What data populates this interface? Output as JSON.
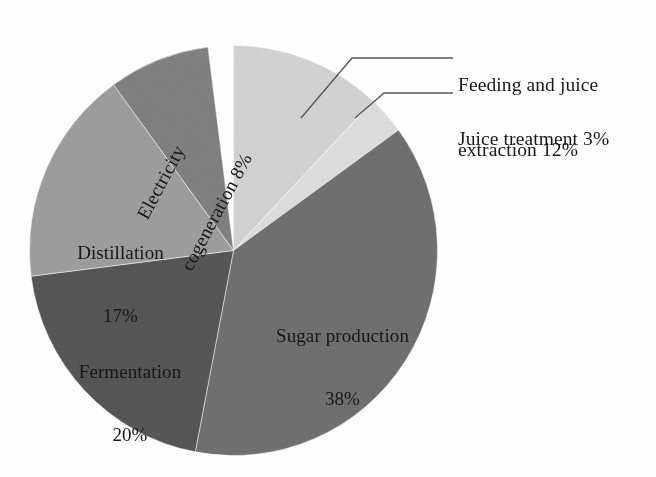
{
  "figure": {
    "type": "pie-chart-figure",
    "background": "#ffffff"
  },
  "chart_data": {
    "type": "pie",
    "title": "",
    "subtitle": "",
    "xlabel": "",
    "ylabel": "",
    "legend_position": "none",
    "grid": false,
    "units": "percent",
    "total": 98,
    "start_angle_deg": 0,
    "direction": "clockwise",
    "labels_show_percent": true,
    "categories": [
      "Feeding and juice extraction",
      "Juice treatment",
      "Sugar production",
      "Fermentation",
      "Distillation",
      "Electricity cogeneration"
    ],
    "values": [
      12,
      3,
      38,
      20,
      17,
      8
    ],
    "slices": [
      {
        "name": "Feeding and juice extraction",
        "value": 12,
        "percent_text": "12%",
        "label_text": "Feeding and juice\nextraction 12%",
        "label_line1": "Feeding and juice",
        "label_line2": "extraction 12%",
        "label_placement": "outside",
        "color": "#e9e9e9",
        "start_deg": 0,
        "end_deg": 43.2
      },
      {
        "name": "Juice treatment",
        "value": 3,
        "percent_text": "3%",
        "label_text": "Juice treatment 3%",
        "label_line1": "Juice treatment 3%",
        "label_line2": "",
        "label_placement": "outside",
        "color": "#efefef",
        "start_deg": 43.2,
        "end_deg": 54.0
      },
      {
        "name": "Sugar production",
        "value": 38,
        "percent_text": "38%",
        "label_text": "Sugar production\n38%",
        "label_line1": "Sugar production",
        "label_line2": "38%",
        "label_placement": "inside",
        "color": "#a9a9a9",
        "start_deg": 54.0,
        "end_deg": 190.8
      },
      {
        "name": "Fermentation",
        "value": 20,
        "percent_text": "20%",
        "label_text": "Fermentation\n20%",
        "label_line1": "Fermentation",
        "label_line2": "20%",
        "label_placement": "inside",
        "color": "#949494",
        "start_deg": 190.8,
        "end_deg": 262.8
      },
      {
        "name": "Distillation",
        "value": 17,
        "percent_text": "17%",
        "label_text": "Distillation\n17%",
        "label_line1": "Distillation",
        "label_line2": "17%",
        "label_placement": "inside",
        "color": "#c9c9c9",
        "start_deg": 262.8,
        "end_deg": 324.0
      },
      {
        "name": "Electricity cogeneration",
        "value": 8,
        "percent_text": "8%",
        "label_text": "Electricity\ncogeneration 8%",
        "label_line1": "Electricity",
        "label_line2": "cogeneration 8%",
        "label_placement": "inside-rotated",
        "color": "#b5b5b5",
        "start_deg": 324.0,
        "end_deg": 352.8
      }
    ],
    "leader_lines": [
      {
        "for": "Feeding and juice extraction",
        "points": "301,118 352,58 453,58"
      },
      {
        "for": "Juice treatment",
        "points": "355,118 384,93 453,93"
      }
    ]
  }
}
